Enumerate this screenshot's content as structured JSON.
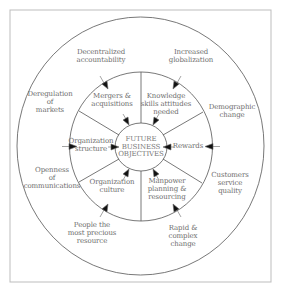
{
  "diagram": {
    "title": "FUTURE\nBUSINESS\nOBJECTIVES",
    "colors": {
      "line": "#555555",
      "frame": "#bdbdbd",
      "text": "#6e6e6e",
      "arrow": "#111111"
    },
    "inner_ring": [
      {
        "label": "Mergers &\nacquisitions"
      },
      {
        "label": "Knowledge\nskills attitudes\nneeded"
      },
      {
        "label": "Rewards"
      },
      {
        "label": "Manpower\nplanning &\nresourcing"
      },
      {
        "label": "Organization\nculture"
      },
      {
        "label": "Organization\nstructure"
      }
    ],
    "outer_ring": [
      {
        "label": "Decentralized\naccountability"
      },
      {
        "label": "Increased\nglobalization"
      },
      {
        "label": "Demographic\nchange"
      },
      {
        "label": "Customers\nservice\nquality"
      },
      {
        "label": "Rapid &\ncomplex\nchange"
      },
      {
        "label": "People the\nmost precious\nresource"
      },
      {
        "label": "Openness\nof\ncommunications"
      },
      {
        "label": "Deregulation\nof\nmarkets"
      }
    ]
  }
}
